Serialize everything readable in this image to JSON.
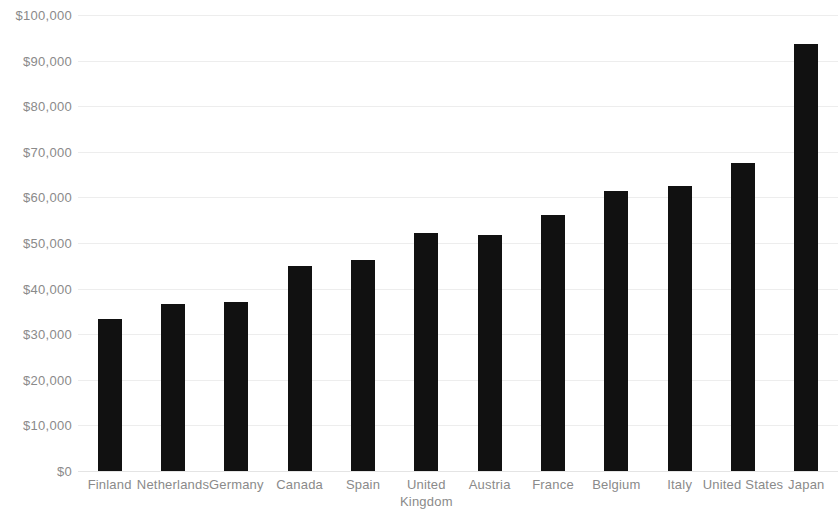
{
  "chart_data": {
    "type": "bar",
    "title": "",
    "subtitle": "",
    "xlabel": "",
    "ylabel": "",
    "categories": [
      "Finland",
      "Netherlands",
      "Germany",
      "Canada",
      "Spain",
      "United Kingdom",
      "Austria",
      "France",
      "Belgium",
      "Italy",
      "United States",
      "Japan"
    ],
    "values": [
      33300,
      36600,
      37000,
      45000,
      46200,
      52300,
      51800,
      56200,
      61400,
      62500,
      67500,
      93700
    ],
    "ylim": [
      0,
      100000
    ],
    "y_ticks": [
      0,
      10000,
      20000,
      30000,
      40000,
      50000,
      60000,
      70000,
      80000,
      90000,
      100000
    ],
    "y_tick_labels": [
      "$0",
      "$10,000",
      "$20,000",
      "$30,000",
      "$40,000",
      "$50,000",
      "$60,000",
      "$70,000",
      "$80,000",
      "$90,000",
      "$100,000"
    ],
    "grid": true,
    "grid_axis": "y",
    "legend": false,
    "legend_position": "none",
    "bar_color": "#111111",
    "grid_color": "#ededed",
    "tick_label_color": "#8a8a8a",
    "background_color": "#ffffff",
    "value_labels_shown": false
  }
}
